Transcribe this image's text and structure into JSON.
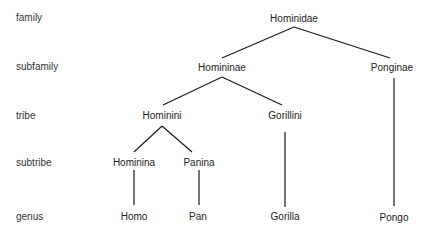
{
  "ranks": [
    {
      "label": "family"
    },
    {
      "label": "subfamily"
    },
    {
      "label": "tribe"
    },
    {
      "label": "subtribe"
    },
    {
      "label": "genus"
    }
  ],
  "nodes": {
    "hominidae": {
      "label": "Hominidae"
    },
    "homininae": {
      "label": "Homininae"
    },
    "ponginae": {
      "label": "Ponginae"
    },
    "hominini": {
      "label": "Hominini"
    },
    "gorillini": {
      "label": "Gorillini"
    },
    "hominina": {
      "label": "Hominina"
    },
    "panina": {
      "label": "Panina"
    },
    "homo": {
      "label": "Homo"
    },
    "pan": {
      "label": "Pan"
    },
    "gorilla": {
      "label": "Gorilla"
    },
    "pongo": {
      "label": "Pongo"
    }
  },
  "edges": [
    {
      "from": "Hominidae",
      "to": "Homininae"
    },
    {
      "from": "Hominidae",
      "to": "Ponginae"
    },
    {
      "from": "Homininae",
      "to": "Hominini"
    },
    {
      "from": "Homininae",
      "to": "Gorillini"
    },
    {
      "from": "Hominini",
      "to": "Hominina"
    },
    {
      "from": "Hominini",
      "to": "Panina"
    },
    {
      "from": "Hominina",
      "to": "Homo"
    },
    {
      "from": "Panina",
      "to": "Pan"
    },
    {
      "from": "Gorillini",
      "to": "Gorilla"
    },
    {
      "from": "Ponginae",
      "to": "Pongo"
    }
  ],
  "colors": {
    "line": "#1a1a1a",
    "text": "#222222",
    "background": "#ffffff"
  }
}
